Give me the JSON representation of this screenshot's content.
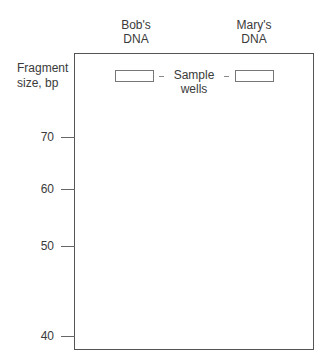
{
  "diagram": {
    "type": "gel-electrophoresis",
    "lanes": [
      {
        "label_line1": "Bob's",
        "label_line2": "DNA"
      },
      {
        "label_line1": "Mary's",
        "label_line2": "DNA"
      }
    ],
    "axis": {
      "title_line1": "Fragment",
      "title_line2": "size, bp",
      "ticks": [
        {
          "label": "70",
          "y": 137
        },
        {
          "label": "60",
          "y": 189
        },
        {
          "label": "50",
          "y": 246
        },
        {
          "label": "40",
          "y": 336
        }
      ]
    },
    "wells_label": {
      "line1": "Sample",
      "line2": "wells"
    }
  }
}
